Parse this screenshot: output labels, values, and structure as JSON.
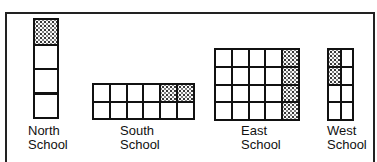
{
  "figure": {
    "schools": [
      {
        "name": "North School",
        "line1": "North",
        "line2": "School",
        "rows": 4,
        "cols": 1,
        "shaded_cells": 1,
        "total_cells": 4
      },
      {
        "name": "South School",
        "line1": "South",
        "line2": "School",
        "rows": 2,
        "cols": 6,
        "shaded_cells": 2,
        "total_cells": 12
      },
      {
        "name": "East School",
        "line1": "East",
        "line2": "School",
        "rows": 4,
        "cols": 5,
        "shaded_cells": 4,
        "total_cells": 20
      },
      {
        "name": "West School",
        "line1": "West",
        "line2": "School",
        "rows": 4,
        "cols": 2,
        "shaded_cells": 2,
        "total_cells": 8
      }
    ],
    "colors": {
      "line": "#111111",
      "shade_dot": "#333333",
      "background": "#ffffff"
    }
  }
}
